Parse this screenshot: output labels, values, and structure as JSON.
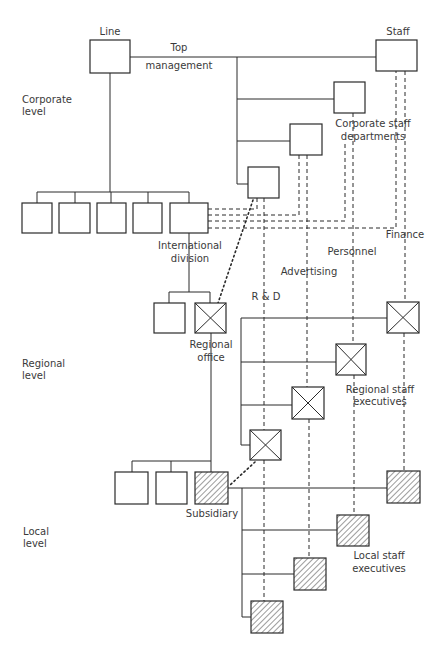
{
  "labels": {
    "line": "Line",
    "staff": "Staff",
    "top": "Top",
    "management": "management",
    "corporate_level_1": "Corporate",
    "corporate_level_2": "level",
    "corporate_staff_1": "Corporate staff",
    "corporate_staff_2": "departments",
    "international_1": "International",
    "international_2": "division",
    "finance": "Finance",
    "personnel": "Personnel",
    "advertising": "Advertising",
    "rd": "R & D",
    "regional_office_1": "Regional",
    "regional_office_2": "office",
    "regional_level_1": "Regional",
    "regional_level_2": "level",
    "regional_staff_1": "Regional staff",
    "regional_staff_2": "executives",
    "subsidiary": "Subsidiary",
    "local_level_1": "Local",
    "local_level_2": "level",
    "local_staff_1": "Local staff",
    "local_staff_2": "executives"
  },
  "legend": {
    "plain_box": "corporate unit",
    "x_box": "regional unit",
    "hatched_box": "local unit"
  }
}
